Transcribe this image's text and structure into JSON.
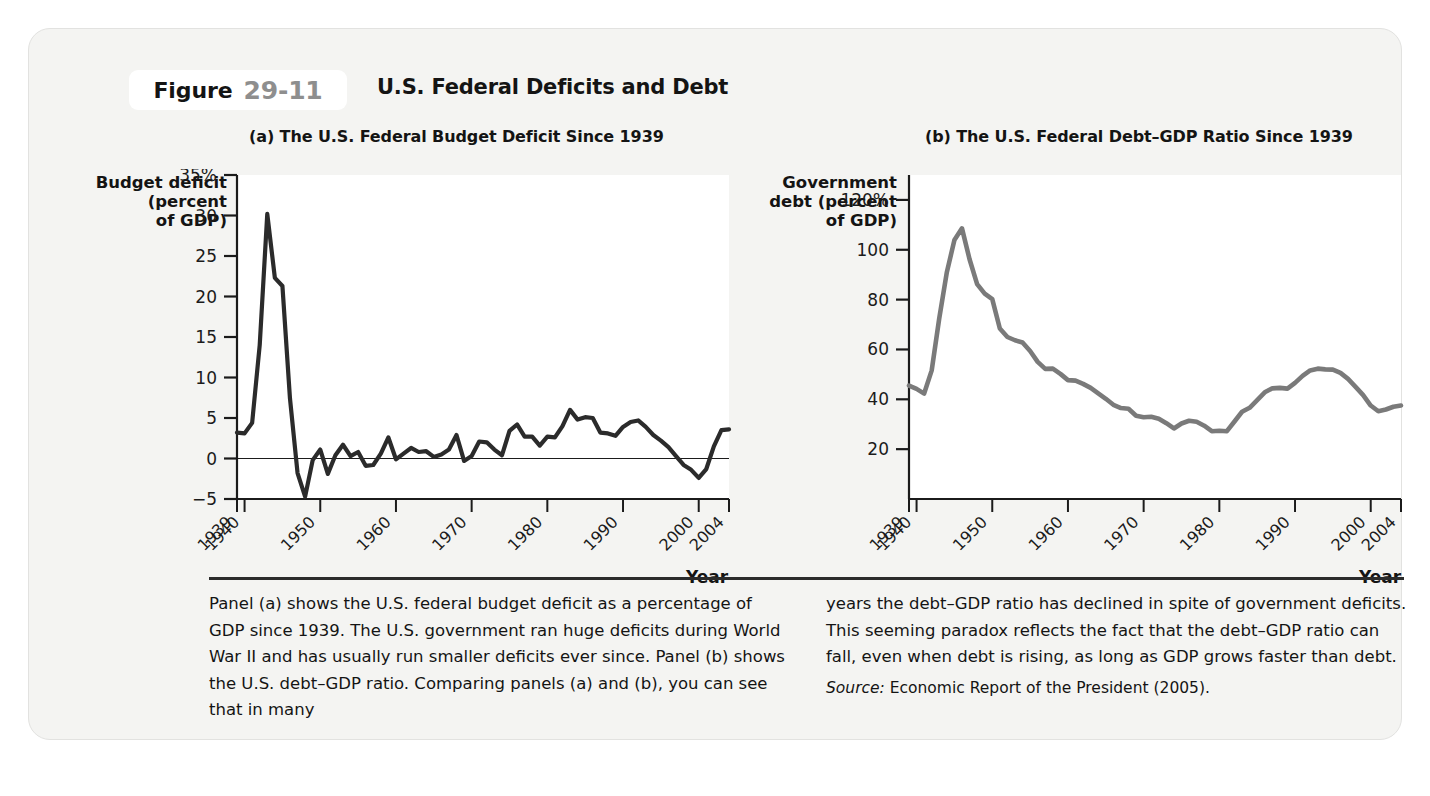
{
  "figure": {
    "label_word": "Figure",
    "number": "29-11",
    "title": "U.S. Federal Deficits and Debt"
  },
  "panels": {
    "a": {
      "title": "(a) The U.S. Federal Budget Deficit Since 1939",
      "ylabel": "Budget deficit\n(percent\nof GDP)",
      "xlabel": "Year"
    },
    "b": {
      "title": "(b) The U.S. Federal Debt–GDP Ratio Since 1939",
      "ylabel": "Government\ndebt (percent\nof GDP)",
      "xlabel": "Year"
    }
  },
  "caption": {
    "left": "Panel (a) shows the U.S. federal budget deficit as a percentage of GDP since 1939. The U.S. government ran huge deficits during World War II and has usually run smaller deficits ever since. Panel (b) shows the U.S. debt–GDP ratio. Comparing panels (a) and (b), you can see that in many",
    "right": "years the debt–GDP ratio has declined in spite of government deficits. This seeming paradox reflects the fact that the debt–GDP ratio can fall, even when debt is rising, as long as GDP grows faster than debt.",
    "source_label": "Source:",
    "source_text": "Economic Report of the President (2005)."
  },
  "colors": {
    "card_background": "#f4f4f2",
    "plot_background": "#ffffff",
    "axis": "#1b1b1b",
    "deficit_line": "#2b2b2b",
    "debt_line": "#7a7a7a",
    "figure_number": "#8e8e8e",
    "divider": "#2b2b2b"
  },
  "chart_data": [
    {
      "type": "line",
      "panel": "a",
      "title": "(a) The U.S. Federal Budget Deficit Since 1939",
      "xlabel": "Year",
      "ylabel": "Budget deficit (percent of GDP)",
      "xlim": [
        1939,
        2004
      ],
      "ylim": [
        -5,
        35
      ],
      "yticks": [
        -5,
        0,
        5,
        10,
        15,
        20,
        25,
        30,
        35
      ],
      "ytick_labels": [
        "−5",
        "0",
        "5",
        "10",
        "15",
        "20",
        "25",
        "30",
        "35%"
      ],
      "xticks": [
        1939,
        1940,
        1950,
        1960,
        1970,
        1980,
        1990,
        2000,
        2004
      ],
      "xtick_labels": [
        "1939",
        "1940",
        "1950",
        "1960",
        "1970",
        "1980",
        "1990",
        "2000",
        "2004"
      ],
      "grid": false,
      "legend": "none",
      "zero_line": true,
      "x": [
        1939,
        1940,
        1941,
        1942,
        1943,
        1944,
        1945,
        1946,
        1947,
        1948,
        1949,
        1950,
        1951,
        1952,
        1953,
        1954,
        1955,
        1956,
        1957,
        1958,
        1959,
        1960,
        1961,
        1962,
        1963,
        1964,
        1965,
        1966,
        1967,
        1968,
        1969,
        1970,
        1971,
        1972,
        1973,
        1974,
        1975,
        1976,
        1977,
        1978,
        1979,
        1980,
        1981,
        1982,
        1983,
        1984,
        1985,
        1986,
        1987,
        1988,
        1989,
        1990,
        1991,
        1992,
        1993,
        1994,
        1995,
        1996,
        1997,
        1998,
        1999,
        2000,
        2001,
        2002,
        2003,
        2004
      ],
      "values": [
        3.2,
        3.1,
        4.4,
        14.0,
        30.2,
        22.3,
        21.3,
        7.4,
        -1.8,
        -4.7,
        -0.2,
        1.1,
        -1.9,
        0.4,
        1.7,
        0.3,
        0.8,
        -0.9,
        -0.8,
        0.6,
        2.6,
        -0.1,
        0.6,
        1.3,
        0.8,
        0.9,
        0.2,
        0.5,
        1.1,
        2.9,
        -0.3,
        0.3,
        2.1,
        2.0,
        1.1,
        0.4,
        3.4,
        4.2,
        2.7,
        2.7,
        1.6,
        2.7,
        2.6,
        4.0,
        6.0,
        4.8,
        5.1,
        5.0,
        3.2,
        3.1,
        2.8,
        3.9,
        4.5,
        4.7,
        3.9,
        2.9,
        2.2,
        1.4,
        0.3,
        -0.8,
        -1.4,
        -2.4,
        -1.3,
        1.5,
        3.5,
        3.6
      ]
    },
    {
      "type": "line",
      "panel": "b",
      "title": "(b) The U.S. Federal Debt–GDP Ratio Since 1939",
      "xlabel": "Year",
      "ylabel": "Government debt (percent of GDP)",
      "xlim": [
        1939,
        2004
      ],
      "ylim": [
        0,
        130
      ],
      "yticks": [
        20,
        40,
        60,
        80,
        100,
        120
      ],
      "ytick_labels": [
        "20",
        "40",
        "60",
        "80",
        "100",
        "120%"
      ],
      "xticks": [
        1939,
        1940,
        1950,
        1960,
        1970,
        1980,
        1990,
        2000,
        2004
      ],
      "xtick_labels": [
        "1939",
        "1940",
        "1950",
        "1960",
        "1970",
        "1980",
        "1990",
        "2000",
        "2004"
      ],
      "grid": false,
      "legend": "none",
      "zero_line": false,
      "x": [
        1939,
        1940,
        1941,
        1942,
        1943,
        1944,
        1945,
        1946,
        1947,
        1948,
        1949,
        1950,
        1951,
        1952,
        1953,
        1954,
        1955,
        1956,
        1957,
        1958,
        1959,
        1960,
        1961,
        1962,
        1963,
        1964,
        1965,
        1966,
        1967,
        1968,
        1969,
        1970,
        1971,
        1972,
        1973,
        1974,
        1975,
        1976,
        1977,
        1978,
        1979,
        1980,
        1981,
        1982,
        1983,
        1984,
        1985,
        1986,
        1987,
        1988,
        1989,
        1990,
        1991,
        1992,
        1993,
        1994,
        1995,
        1996,
        1997,
        1998,
        1999,
        2000,
        2001,
        2002,
        2003,
        2004
      ],
      "values": [
        45.5,
        44.2,
        42.3,
        51.6,
        72.6,
        91.0,
        103.9,
        108.6,
        96.2,
        86.2,
        82.4,
        80.2,
        68.4,
        65.0,
        63.7,
        62.8,
        59.4,
        55.0,
        52.2,
        52.3,
        50.2,
        47.7,
        47.5,
        46.2,
        44.6,
        42.4,
        40.2,
        37.8,
        36.5,
        36.2,
        33.4,
        32.8,
        33.0,
        32.2,
        30.4,
        28.3,
        30.3,
        31.4,
        31.0,
        29.4,
        27.2,
        27.4,
        27.2,
        31.1,
        35.0,
        36.6,
        39.7,
        42.8,
        44.4,
        44.6,
        44.3,
        46.6,
        49.4,
        51.6,
        52.3,
        52.0,
        51.9,
        50.6,
        48.2,
        45.0,
        41.7,
        37.5,
        35.2,
        35.9,
        37.0,
        37.5
      ]
    }
  ]
}
